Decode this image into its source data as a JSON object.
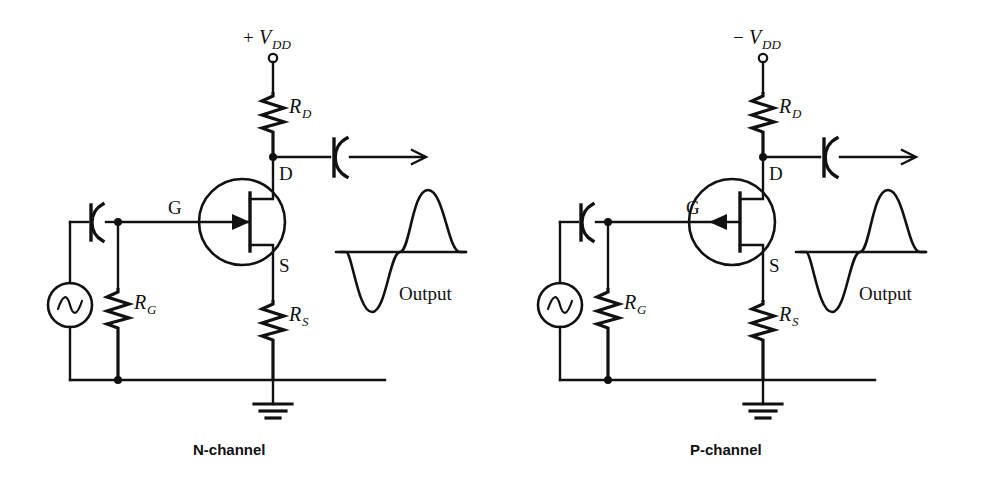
{
  "figure": {
    "background": "#ffffff",
    "ink_color": "#111111"
  },
  "circuits": [
    {
      "id": "n-channel",
      "caption": "N-channel",
      "supply_label_sign": "+",
      "supply_label_base": "V",
      "supply_label_sub": "DD",
      "drain_resistor": {
        "base": "R",
        "sub": "D"
      },
      "source_resistor": {
        "base": "R",
        "sub": "S"
      },
      "gate_resistor": {
        "base": "R",
        "sub": "G"
      },
      "terminals": {
        "gate": "G",
        "drain": "D",
        "source": "S"
      },
      "output_label": "Output",
      "gate_arrow_direction": "inward",
      "waveform": {
        "phase": "negative-first",
        "shape": "sine"
      }
    },
    {
      "id": "p-channel",
      "caption": "P-channel",
      "supply_label_sign": "−",
      "supply_label_base": "V",
      "supply_label_sub": "DD",
      "drain_resistor": {
        "base": "R",
        "sub": "D"
      },
      "source_resistor": {
        "base": "R",
        "sub": "S"
      },
      "gate_resistor": {
        "base": "R",
        "sub": "G"
      },
      "terminals": {
        "gate": "G",
        "drain": "D",
        "source": "S"
      },
      "output_label": "Output",
      "gate_arrow_direction": "outward",
      "waveform": {
        "phase": "negative-first",
        "shape": "sine"
      }
    }
  ],
  "components": {
    "ac_source_icon": "ac-source-sine-icon",
    "ground_icon": "ground-icon",
    "capacitor_icon": "polarized-capacitor-icon",
    "resistor_icon": "resistor-zigzag-icon",
    "jfet_icon": "jfet-symbol-icon",
    "supply_terminal_icon": "open-terminal-circle-icon",
    "output_arrow_icon": "arrow-right-icon",
    "junction_icon": "junction-dot-icon"
  }
}
